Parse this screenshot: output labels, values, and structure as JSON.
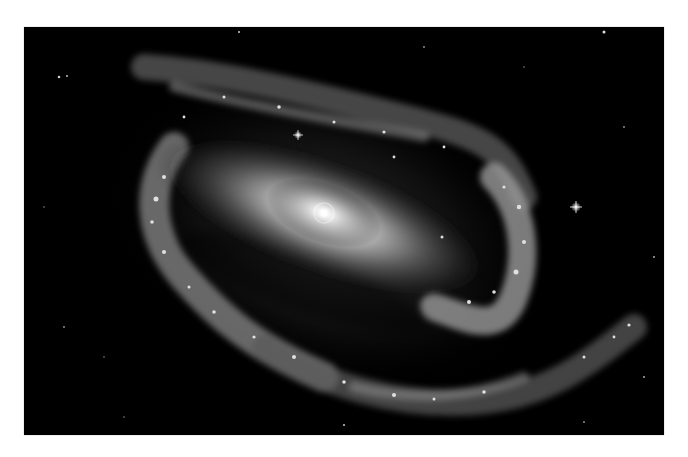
{
  "image": {
    "subject": "barred spiral galaxy",
    "description": "Grayscale astronomical photograph of a barred spiral galaxy with bright elongated central bar, spiral arms curving around, scattered foreground stars on a black background",
    "colors": {
      "page_background": "#ffffff",
      "sky": "#000000",
      "core": "#f2f2f2",
      "bar": "#bdbdbd",
      "arms": "#8a8a8a"
    }
  }
}
